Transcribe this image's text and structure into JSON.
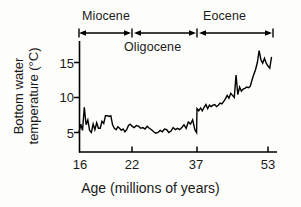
{
  "chart_data": {
    "type": "line",
    "title": "",
    "xlabel": "Age (millions of years)",
    "ylabel_line1": "Bottom water",
    "ylabel_line2": "temperature (°C)",
    "xticks": [
      16,
      22,
      37,
      53
    ],
    "xtick_labels": [
      "16",
      "22",
      "37",
      "53"
    ],
    "yticks": [
      5,
      10,
      15
    ],
    "ytick_labels": [
      "5",
      "10",
      "15"
    ],
    "xlim": [
      16,
      53.8
    ],
    "ylim": [
      3.2,
      18.2
    ],
    "grid": false,
    "legend": null,
    "axis_note": "x-axis increases left to right in age; tick spacing is non-linear (16,22,37,53 evenly spaced segments)",
    "epochs": [
      {
        "name": "Miocene",
        "start": 16,
        "end": 22,
        "label_position": "above-bar"
      },
      {
        "name": "Oligocene",
        "start": 22,
        "end": 37,
        "label_position": "below-bar"
      },
      {
        "name": "Eocene",
        "start": 37,
        "end": 53,
        "label_position": "above-bar"
      }
    ],
    "series": [
      {
        "name": "Bottom water temperature",
        "color": "#000000",
        "x": [
          16.0,
          16.2,
          16.4,
          16.6,
          16.8,
          17.0,
          17.2,
          17.4,
          17.6,
          17.8,
          18.0,
          18.2,
          18.4,
          18.6,
          18.8,
          19.0,
          19.2,
          19.4,
          19.6,
          19.8,
          20.0,
          20.2,
          20.4,
          20.6,
          20.8,
          21.0,
          21.2,
          21.4,
          21.6,
          21.8,
          22.0,
          22.5,
          23.0,
          23.5,
          24.0,
          24.5,
          25.0,
          25.5,
          26.0,
          26.5,
          27.0,
          27.5,
          28.0,
          28.5,
          29.0,
          29.5,
          30.0,
          30.5,
          31.0,
          31.5,
          32.0,
          32.5,
          33.0,
          33.5,
          34.0,
          34.5,
          35.0,
          35.5,
          36.0,
          36.5,
          36.9,
          37.0,
          37.4,
          37.8,
          38.2,
          38.6,
          39.0,
          39.4,
          39.8,
          40.2,
          40.6,
          41.0,
          41.4,
          41.8,
          42.2,
          42.6,
          43.0,
          43.4,
          43.8,
          44.2,
          44.6,
          45.0,
          45.4,
          45.8,
          46.2,
          46.6,
          47.0,
          47.4,
          47.8,
          48.2,
          48.6,
          49.0,
          49.4,
          49.8,
          50.2,
          50.6,
          51.0,
          51.4,
          51.8,
          52.2,
          52.6,
          53.0,
          53.4,
          53.8
        ],
        "y": [
          5.0,
          6.2,
          5.3,
          8.6,
          6.1,
          6.8,
          5.3,
          5.0,
          6.2,
          5.4,
          6.4,
          5.6,
          5.6,
          6.6,
          6.3,
          7.4,
          7.4,
          7.3,
          7.4,
          6.1,
          5.6,
          5.4,
          5.8,
          5.6,
          5.3,
          5.5,
          5.1,
          5.4,
          6.0,
          6.2,
          5.9,
          5.7,
          6.0,
          5.9,
          5.6,
          5.7,
          5.5,
          5.9,
          5.6,
          5.4,
          5.1,
          4.9,
          5.0,
          5.3,
          5.1,
          5.5,
          5.4,
          5.0,
          5.2,
          5.7,
          5.4,
          5.6,
          5.4,
          5.7,
          6.1,
          5.6,
          6.5,
          6.2,
          6.8,
          5.4,
          5.0,
          8.4,
          8.1,
          8.5,
          8.1,
          8.6,
          9.0,
          8.4,
          8.9,
          8.7,
          8.9,
          9.0,
          8.7,
          8.9,
          9.2,
          9.1,
          9.4,
          9.8,
          10.3,
          9.9,
          10.6,
          10.3,
          10.0,
          13.2,
          10.4,
          11.5,
          10.9,
          11.2,
          11.3,
          11.5,
          11.4,
          11.6,
          12.5,
          13.3,
          14.0,
          15.0,
          16.7,
          15.4,
          14.9,
          15.6,
          14.9,
          14.5,
          14.2,
          15.8
        ]
      }
    ]
  }
}
